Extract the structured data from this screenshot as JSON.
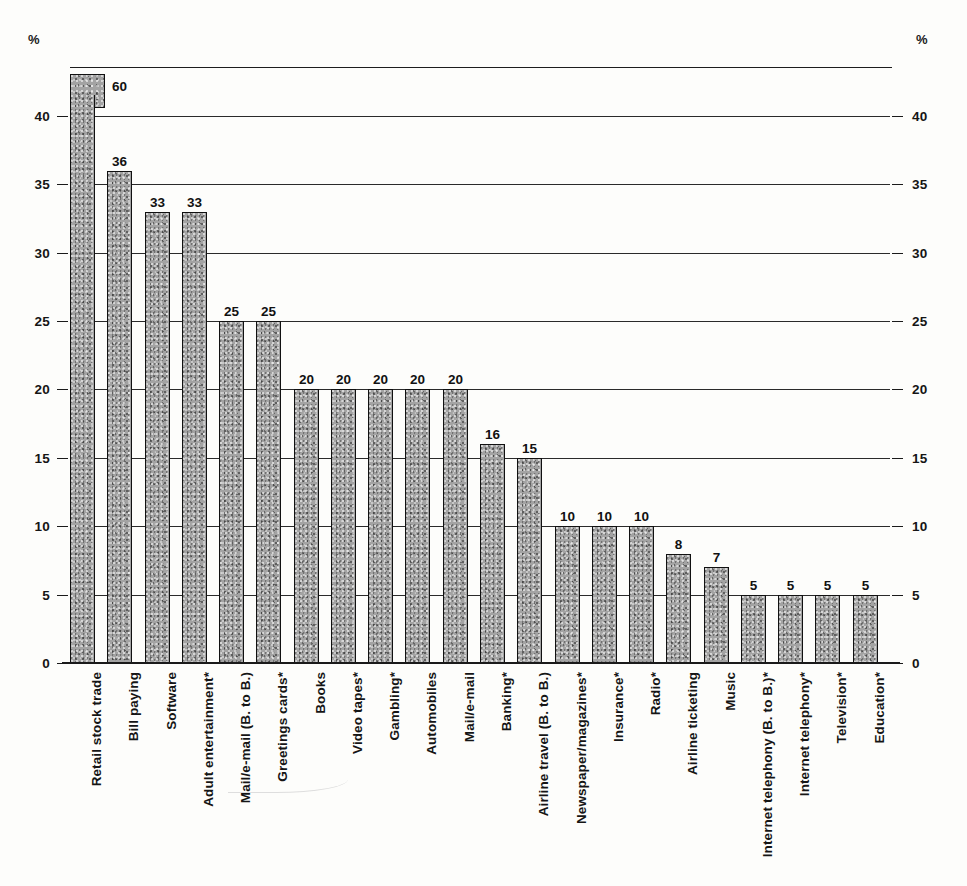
{
  "chart_data": {
    "type": "bar",
    "title": "",
    "subtitle": "",
    "xlabel": "",
    "ylabel": "",
    "unit_label_left": "%",
    "unit_label_right": "%",
    "ylim": [
      0,
      43.5
    ],
    "yticks": [
      0,
      5,
      10,
      15,
      20,
      25,
      30,
      35,
      40
    ],
    "ytick_labels": [
      "0",
      "5",
      "10",
      "15",
      "20",
      "25",
      "30",
      "35",
      "40"
    ],
    "grid": true,
    "legend": null,
    "axis_break": {
      "present": true,
      "broken_category": "Retail stock trade",
      "true_value": 60,
      "cap_label": "60",
      "drawn_top": 41.5,
      "note": "first bar is truncated at the top of the axis; a detached segment above the frame carries the label 60"
    },
    "categories": [
      "Retail stock trade",
      "Bill paying",
      "Software",
      "Adult entertainment*",
      "Mail/e-mail (B. to B.)",
      "Greetings cards*",
      "Books",
      "Video tapes*",
      "Gambling*",
      "Automobiles",
      "Mail/e-mail",
      "Banking*",
      "Airline travel (B. to B.)",
      "Newspaper/magazines*",
      "Insurance*",
      "Radio*",
      "Airline ticketing",
      "Music",
      "Internet telephony (B. to B.)*",
      "Internet telephony*",
      "Television*",
      "Education*"
    ],
    "values": [
      60,
      36,
      33,
      33,
      25,
      25,
      20,
      20,
      20,
      20,
      20,
      16,
      15,
      10,
      10,
      10,
      8,
      7,
      5,
      5,
      5,
      5
    ],
    "value_labels": [
      "60",
      "36",
      "33",
      "33",
      "25",
      "25",
      "20",
      "20",
      "20",
      "20",
      "20",
      "16",
      "15",
      "10",
      "10",
      "10",
      "8",
      "7",
      "5",
      "5",
      "5",
      "5"
    ],
    "bar_color": "#a3a3a3",
    "bar_edge_color": "#111111",
    "grid_color": "#2a2a2a"
  }
}
